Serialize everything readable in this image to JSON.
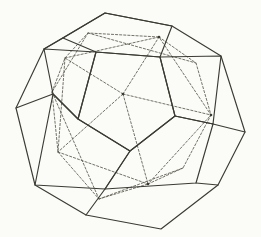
{
  "figure": {
    "background_color": "#fbfbf8",
    "solid_stroke_color": "#3b3b33",
    "dashed_stroke_color": "#5a5a4e",
    "width": 261,
    "height": 237
  },
  "chart_data": {
    "type": "diagram",
    "xlabel": "",
    "ylabel": "",
    "shapes": [
      {
        "name": "dodecahedron-outer-silhouette",
        "style": "solid",
        "closed": true,
        "points": [
          [
            105,
            13
          ],
          [
            172,
            26
          ],
          [
            221,
            56
          ],
          [
            245,
            132
          ],
          [
            218,
            185
          ],
          [
            161,
            229
          ],
          [
            86,
            215
          ],
          [
            35,
            185
          ],
          [
            16,
            108
          ],
          [
            44,
            49
          ]
        ]
      },
      {
        "name": "dodecahedron-top-face",
        "style": "solid",
        "closed": true,
        "points": [
          [
            105,
            13
          ],
          [
            172,
            26
          ],
          [
            160,
            57
          ],
          [
            96,
            52
          ],
          [
            63,
            38
          ]
        ]
      },
      {
        "name": "dodecahedron-front-face",
        "style": "solid",
        "closed": true,
        "points": [
          [
            96,
            52
          ],
          [
            160,
            57
          ],
          [
            175,
            116
          ],
          [
            130,
            151
          ],
          [
            78,
            119
          ]
        ]
      },
      {
        "name": "dodecahedron-right-face",
        "style": "solid",
        "closed": true,
        "points": [
          [
            160,
            57
          ],
          [
            221,
            56
          ],
          [
            213,
            124
          ],
          [
            175,
            116
          ]
        ]
      },
      {
        "name": "dodecahedron-left-face",
        "style": "solid",
        "closed": true,
        "points": [
          [
            44,
            49
          ],
          [
            96,
            52
          ],
          [
            78,
            119
          ],
          [
            53,
            94
          ]
        ]
      },
      {
        "name": "dodecahedron-lower-left-face",
        "style": "solid",
        "closed": true,
        "points": [
          [
            53,
            94
          ],
          [
            78,
            119
          ],
          [
            130,
            151
          ],
          [
            105,
            189
          ],
          [
            35,
            185
          ]
        ]
      },
      {
        "name": "dodecahedron-lower-right-face",
        "style": "solid",
        "closed": true,
        "points": [
          [
            130,
            151
          ],
          [
            175,
            116
          ],
          [
            213,
            124
          ],
          [
            196,
            183
          ],
          [
            105,
            189
          ]
        ]
      },
      {
        "name": "dodecahedron-edge-left-outer",
        "style": "solid",
        "closed": false,
        "points": [
          [
            16,
            108
          ],
          [
            53,
            94
          ]
        ]
      },
      {
        "name": "dodecahedron-edge-top-left-outer",
        "style": "solid",
        "closed": false,
        "points": [
          [
            44,
            49
          ],
          [
            63,
            38
          ]
        ]
      },
      {
        "name": "dodecahedron-edge-bottom-left-outer",
        "style": "solid",
        "closed": false,
        "points": [
          [
            105,
            189
          ],
          [
            86,
            215
          ]
        ]
      },
      {
        "name": "dodecahedron-edge-bottom-right-outer",
        "style": "solid",
        "closed": false,
        "points": [
          [
            196,
            183
          ],
          [
            218,
            185
          ]
        ]
      },
      {
        "name": "dodecahedron-edge-right-outer",
        "style": "solid",
        "closed": false,
        "points": [
          [
            213,
            124
          ],
          [
            245,
            132
          ]
        ]
      },
      {
        "name": "icosahedron-front-vertex-hub",
        "style": "dashed",
        "closed": false,
        "points": [
          [
            123,
            94
          ]
        ]
      },
      {
        "name": "icosahedron-edge-a",
        "style": "dashed",
        "closed": false,
        "points": [
          [
            123,
            94
          ],
          [
            159,
            37
          ]
        ]
      },
      {
        "name": "icosahedron-edge-b",
        "style": "dashed",
        "closed": false,
        "points": [
          [
            123,
            94
          ],
          [
            211,
            115
          ]
        ]
      },
      {
        "name": "icosahedron-edge-c",
        "style": "dashed",
        "closed": false,
        "points": [
          [
            123,
            94
          ],
          [
            148,
            184
          ]
        ]
      },
      {
        "name": "icosahedron-edge-d",
        "style": "dashed",
        "closed": false,
        "points": [
          [
            123,
            94
          ],
          [
            58,
            152
          ]
        ]
      },
      {
        "name": "icosahedron-edge-e",
        "style": "dashed",
        "closed": false,
        "points": [
          [
            123,
            94
          ],
          [
            65,
            58
          ]
        ]
      },
      {
        "name": "icosahedron-upper-band",
        "style": "dashed",
        "closed": false,
        "points": [
          [
            65,
            58
          ],
          [
            159,
            37
          ],
          [
            211,
            115
          ]
        ]
      },
      {
        "name": "icosahedron-lower-band",
        "style": "dashed",
        "closed": false,
        "points": [
          [
            58,
            152
          ],
          [
            148,
            184
          ],
          [
            211,
            115
          ]
        ]
      },
      {
        "name": "icosahedron-left-band",
        "style": "dashed",
        "closed": false,
        "points": [
          [
            65,
            58
          ],
          [
            58,
            152
          ]
        ]
      },
      {
        "name": "icosahedron-rear-upper-left",
        "style": "dashed",
        "closed": false,
        "points": [
          [
            65,
            58
          ],
          [
            88,
            33
          ],
          [
            159,
            37
          ]
        ]
      },
      {
        "name": "icosahedron-rear-left-spine",
        "style": "dashed",
        "closed": false,
        "points": [
          [
            88,
            33
          ],
          [
            52,
            92
          ],
          [
            58,
            152
          ]
        ]
      },
      {
        "name": "icosahedron-rear-left-diagonal",
        "style": "dashed",
        "closed": false,
        "points": [
          [
            52,
            92
          ],
          [
            65,
            58
          ]
        ]
      },
      {
        "name": "icosahedron-rear-bottom",
        "style": "dashed",
        "closed": false,
        "points": [
          [
            58,
            152
          ],
          [
            99,
            199
          ],
          [
            148,
            184
          ]
        ]
      },
      {
        "name": "icosahedron-rear-right-lower",
        "style": "dashed",
        "closed": false,
        "points": [
          [
            99,
            199
          ],
          [
            183,
            168
          ],
          [
            211,
            115
          ]
        ]
      },
      {
        "name": "icosahedron-rear-right-spine",
        "style": "dashed",
        "closed": false,
        "points": [
          [
            148,
            184
          ],
          [
            183,
            168
          ]
        ]
      },
      {
        "name": "icosahedron-rear-right-upper",
        "style": "dashed",
        "closed": false,
        "points": [
          [
            159,
            37
          ],
          [
            196,
            63
          ],
          [
            211,
            115
          ]
        ]
      },
      {
        "name": "icosahedron-rear-top-link",
        "style": "dashed",
        "closed": false,
        "points": [
          [
            88,
            33
          ],
          [
            196,
            63
          ]
        ]
      },
      {
        "name": "icosahedron-rear-cross-link",
        "style": "dashed",
        "closed": false,
        "points": [
          [
            52,
            92
          ],
          [
            99,
            199
          ]
        ]
      }
    ],
    "vertex_dots": [
      {
        "name": "front-hub",
        "x": 123,
        "y": 94
      },
      {
        "name": "right-hub",
        "x": 211,
        "y": 115
      },
      {
        "name": "bottom-hub",
        "x": 148,
        "y": 184
      },
      {
        "name": "top-hub",
        "x": 159,
        "y": 37
      }
    ]
  }
}
